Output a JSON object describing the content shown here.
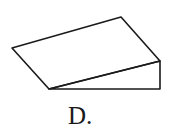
{
  "figure": {
    "label": "D.",
    "shape": "wedge-ramp-3d",
    "stroke_color": "#1a1a1a",
    "vertices": {
      "top_left": [
        12,
        48
      ],
      "top_back": [
        121,
        17
      ],
      "right_top": [
        160,
        61
      ],
      "right_bottom": [
        160,
        89
      ],
      "bottom_left": [
        49,
        89
      ]
    }
  }
}
